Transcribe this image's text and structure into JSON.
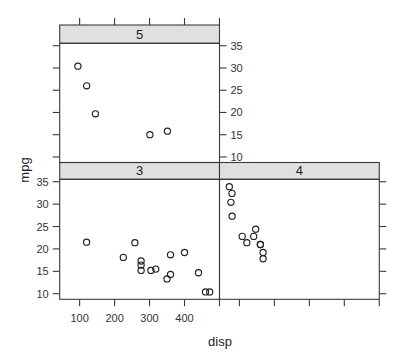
{
  "chart_data": {
    "type": "scatter",
    "title": "",
    "xlabel": "disp",
    "ylabel": "mpg",
    "conditioning_variable": "gear",
    "xlim": [
      43.04,
      500.06
    ],
    "ylim": [
      8.755,
      35.545
    ],
    "xticks": [
      100,
      200,
      300,
      400,
      500
    ],
    "xtick_labels": [
      "100",
      "200",
      "300",
      "400",
      ""
    ],
    "yticks": [
      10,
      15,
      20,
      25,
      30,
      35
    ],
    "ytick_labels": [
      "10",
      "15",
      "20",
      "25",
      "30",
      "35"
    ],
    "grid": false,
    "legend": null,
    "layout": "2x2 trellis (panels: 3 bottom-left, 4 bottom-right, 5 top-left)",
    "panels": [
      {
        "strip": "3",
        "points": [
          [
            258,
            21.4
          ],
          [
            360,
            18.7
          ],
          [
            225,
            18.1
          ],
          [
            360,
            14.3
          ],
          [
            275.8,
            16.4
          ],
          [
            275.8,
            17.3
          ],
          [
            275.8,
            15.2
          ],
          [
            472,
            10.4
          ],
          [
            460,
            10.4
          ],
          [
            440,
            14.7
          ],
          [
            120.1,
            21.5
          ],
          [
            318,
            15.5
          ],
          [
            304,
            15.2
          ],
          [
            350,
            13.3
          ],
          [
            400,
            19.2
          ]
        ]
      },
      {
        "strip": "4",
        "points": [
          [
            160,
            21.0
          ],
          [
            160,
            21.0
          ],
          [
            108,
            22.8
          ],
          [
            146.7,
            24.4
          ],
          [
            140.8,
            22.8
          ],
          [
            167.6,
            19.2
          ],
          [
            167.6,
            17.8
          ],
          [
            78.7,
            32.4
          ],
          [
            75.7,
            30.4
          ],
          [
            71.1,
            33.9
          ],
          [
            79,
            27.3
          ],
          [
            121,
            21.4
          ]
        ]
      },
      {
        "strip": "5",
        "points": [
          [
            120.3,
            26.0
          ],
          [
            95.1,
            30.4
          ],
          [
            351,
            15.8
          ],
          [
            145,
            19.7
          ],
          [
            301,
            15.0
          ]
        ]
      }
    ]
  }
}
